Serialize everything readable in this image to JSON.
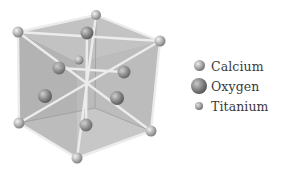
{
  "diagram": {
    "title": "",
    "structure": "perovskite unit cell",
    "colors": {
      "cube_face": "#b8b8b8",
      "bond": "#e8e8e8",
      "calcium": "#b4b4b4",
      "oxygen": "#8c8c8c",
      "titanium": "#a6a6a6"
    }
  },
  "legend": {
    "items": [
      {
        "label": "Calcium",
        "icon": "calcium-sphere-icon"
      },
      {
        "label": "Oxygen",
        "icon": "oxygen-sphere-icon"
      },
      {
        "label": "Titanium",
        "icon": "titanium-sphere-icon"
      }
    ]
  }
}
